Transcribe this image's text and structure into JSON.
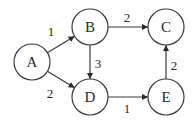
{
  "graph": {
    "type": "directed-weighted",
    "nodes": [
      {
        "id": "A",
        "label": "A",
        "cx": 32,
        "cy": 62
      },
      {
        "id": "B",
        "label": "B",
        "cx": 90,
        "cy": 27
      },
      {
        "id": "C",
        "label": "C",
        "cx": 166,
        "cy": 27
      },
      {
        "id": "D",
        "label": "D",
        "cx": 90,
        "cy": 97
      },
      {
        "id": "E",
        "label": "E",
        "cx": 166,
        "cy": 97
      }
    ],
    "node_radius": 18,
    "edges": [
      {
        "from": "A",
        "to": "B",
        "weight": "1",
        "label_x": 51,
        "label_y": 31
      },
      {
        "from": "A",
        "to": "D",
        "weight": "2",
        "label_x": 50,
        "label_y": 93
      },
      {
        "from": "B",
        "to": "C",
        "weight": "2",
        "label_x": 127,
        "label_y": 17
      },
      {
        "from": "B",
        "to": "D",
        "weight": "3",
        "label_x": 98,
        "label_y": 63
      },
      {
        "from": "D",
        "to": "E",
        "weight": "1",
        "label_x": 127,
        "label_y": 108
      },
      {
        "from": "E",
        "to": "C",
        "weight": "2",
        "label_x": 174,
        "label_y": 65
      }
    ],
    "colors": {
      "stroke": "#3a3a3a",
      "text": "#2a2a2a",
      "background": "#ffffff"
    }
  }
}
